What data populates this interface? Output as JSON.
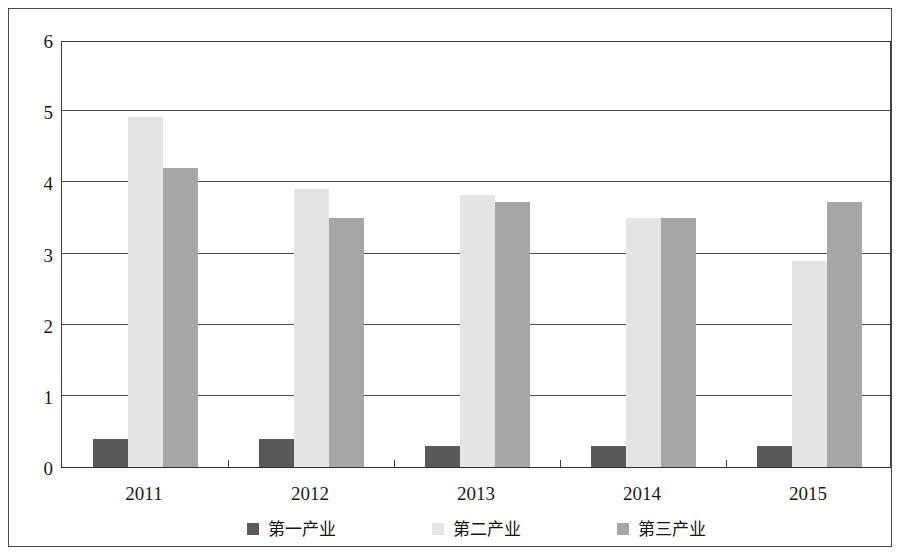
{
  "chart_data": {
    "type": "bar",
    "title": "",
    "xlabel": "",
    "ylabel": "",
    "categories": [
      "2011",
      "2012",
      "2013",
      "2014",
      "2015"
    ],
    "ylim": [
      0,
      6
    ],
    "yticks": [
      0,
      1,
      2,
      3,
      4,
      5,
      6
    ],
    "ytick_labels": [
      "0",
      "1",
      "2",
      "3",
      "4",
      "5",
      "6"
    ],
    "grid": true,
    "grid_axis": "y",
    "legend_position": "bottom",
    "series": [
      {
        "name": "第一产业",
        "color": "#595959",
        "values": [
          0.4,
          0.4,
          0.3,
          0.3,
          0.3
        ]
      },
      {
        "name": "第二产业",
        "color": "#e4e4e4",
        "values": [
          4.92,
          3.9,
          3.82,
          3.5,
          2.9
        ]
      },
      {
        "name": "第三产业",
        "color": "#a6a6a6",
        "values": [
          4.2,
          3.5,
          3.72,
          3.5,
          3.72
        ]
      }
    ]
  },
  "axes": {
    "y_labels": [
      "6",
      "5",
      "4",
      "3",
      "2",
      "1",
      "0"
    ],
    "x_labels": [
      "2011",
      "2012",
      "2013",
      "2014",
      "2015"
    ]
  },
  "legend": {
    "items": [
      {
        "label": "第一产业",
        "color": "#595959"
      },
      {
        "label": "第二产业",
        "color": "#e4e4e4"
      },
      {
        "label": "第三产业",
        "color": "#a6a6a6"
      }
    ]
  }
}
